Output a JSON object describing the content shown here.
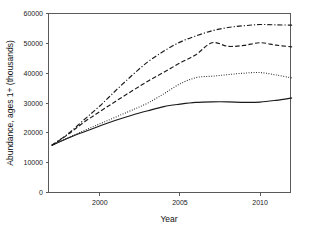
{
  "chart_data": {
    "type": "line",
    "title": "",
    "subtitle": "",
    "xlabel": "Year",
    "ylabel": "Abundance, ages 1+ (thousands)",
    "xlim": [
      1996.8,
      2011.9
    ],
    "ylim": [
      0,
      60000
    ],
    "grid": false,
    "legend": "none",
    "x_ticks": [
      2000,
      2005,
      2010
    ],
    "x_tick_labels": [
      "2000",
      "2005",
      "2010"
    ],
    "y_ticks": [
      0,
      10000,
      20000,
      30000,
      40000,
      50000,
      60000
    ],
    "y_tick_labels": [
      "0",
      "10000",
      "20000",
      "30000",
      "40000",
      "50000",
      "60000"
    ],
    "x": [
      1997,
      1998,
      1999,
      2000,
      2001,
      2002,
      2003,
      2004,
      2005,
      2006,
      2007,
      2008,
      2009,
      2010,
      2011,
      2012
    ],
    "series": [
      {
        "name": "series-dash-dot-highest",
        "style": "dash-dot",
        "color": "#1a1a1a",
        "values": [
          15800,
          19600,
          24300,
          29000,
          34200,
          39200,
          43800,
          47400,
          50400,
          52500,
          54200,
          55300,
          55900,
          56300,
          56200,
          56100
        ]
      },
      {
        "name": "series-dashed",
        "style": "dashed",
        "color": "#1a1a1a",
        "values": [
          15800,
          19400,
          23500,
          27100,
          30600,
          34000,
          37300,
          40300,
          43400,
          46200,
          50200,
          49000,
          49300,
          50200,
          49400,
          48800
        ]
      },
      {
        "name": "series-dotted",
        "style": "dotted",
        "color": "#1a1a1a",
        "values": [
          15800,
          18300,
          20700,
          23000,
          25300,
          27600,
          30000,
          33100,
          36400,
          38500,
          39000,
          39500,
          40000,
          40200,
          39400,
          38400
        ]
      },
      {
        "name": "series-solid-lowest",
        "style": "solid",
        "color": "#1a1a1a",
        "values": [
          15800,
          18200,
          20300,
          22300,
          24200,
          25900,
          27400,
          28800,
          29600,
          30200,
          30400,
          30400,
          30200,
          30300,
          30900,
          31700
        ]
      }
    ]
  },
  "axes": {
    "y_title": "Abundance, ages 1+ (thousands)",
    "x_title": "Year"
  }
}
